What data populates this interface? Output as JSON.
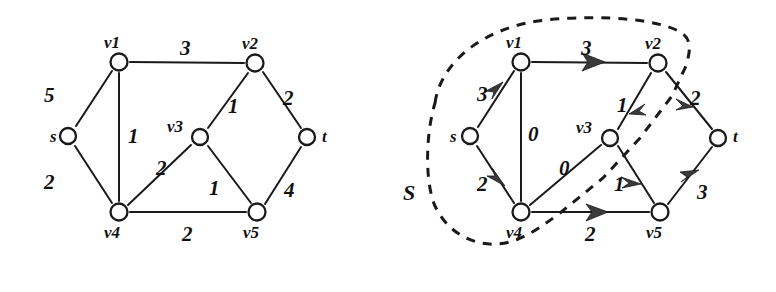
{
  "figure": {
    "background_color": "#ffffff",
    "ink_color": "#1a1a1a"
  },
  "left_graph": {
    "name": "capacity-graph",
    "nodes": [
      {
        "id": "s",
        "label": "s",
        "x": 68,
        "y": 136,
        "label_x": 50,
        "label_y": 128
      },
      {
        "id": "v1",
        "label": "v1",
        "x": 119,
        "y": 62,
        "label_x": 104,
        "label_y": 34
      },
      {
        "id": "v2",
        "label": "v2",
        "x": 255,
        "y": 63,
        "label_x": 242,
        "label_y": 35
      },
      {
        "id": "v3",
        "label": "v3",
        "x": 200,
        "y": 137,
        "label_x": 167,
        "label_y": 118
      },
      {
        "id": "v4",
        "label": "v4",
        "x": 119,
        "y": 212,
        "label_x": 104,
        "label_y": 224
      },
      {
        "id": "v5",
        "label": "v5",
        "x": 257,
        "y": 212,
        "label_x": 243,
        "label_y": 224
      },
      {
        "id": "t",
        "label": "t",
        "x": 307,
        "y": 137,
        "label_x": 322,
        "label_y": 128
      }
    ],
    "edges": [
      {
        "from": "s",
        "to": "v1",
        "weight": "5",
        "label_x": 44,
        "label_y": 85
      },
      {
        "from": "s",
        "to": "v4",
        "weight": "2",
        "label_x": 44,
        "label_y": 172
      },
      {
        "from": "v1",
        "to": "v2",
        "weight": "3",
        "label_x": 180,
        "label_y": 38
      },
      {
        "from": "v1",
        "to": "v4",
        "weight": "1",
        "label_x": 128,
        "label_y": 126
      },
      {
        "from": "v3",
        "to": "v2",
        "weight": "1",
        "label_x": 228,
        "label_y": 96
      },
      {
        "from": "v2",
        "to": "t",
        "weight": "2",
        "label_x": 283,
        "label_y": 88
      },
      {
        "from": "v4",
        "to": "v3",
        "weight": "2",
        "label_x": 156,
        "label_y": 158
      },
      {
        "from": "v3",
        "to": "v5",
        "weight": "1",
        "label_x": 209,
        "label_y": 178
      },
      {
        "from": "v4",
        "to": "v5",
        "weight": "2",
        "label_x": 182,
        "label_y": 224
      },
      {
        "from": "v5",
        "to": "t",
        "weight": "4",
        "label_x": 284,
        "label_y": 180
      }
    ]
  },
  "right_graph": {
    "name": "flow-graph",
    "set_label": "S",
    "set_label_x": 403,
    "set_label_y": 182,
    "nodes": [
      {
        "id": "s",
        "label": "s",
        "x": 470,
        "y": 136,
        "label_x": 450,
        "label_y": 128
      },
      {
        "id": "v1",
        "label": "v1",
        "x": 521,
        "y": 62,
        "label_x": 506,
        "label_y": 34
      },
      {
        "id": "v2",
        "label": "v2",
        "x": 658,
        "y": 63,
        "label_x": 645,
        "label_y": 35
      },
      {
        "id": "v3",
        "label": "v3",
        "x": 610,
        "y": 138,
        "label_x": 576,
        "label_y": 119
      },
      {
        "id": "v4",
        "label": "v4",
        "x": 521,
        "y": 212,
        "label_x": 506,
        "label_y": 224
      },
      {
        "id": "v5",
        "label": "v5",
        "x": 660,
        "y": 212,
        "label_x": 646,
        "label_y": 224
      },
      {
        "id": "t",
        "label": "t",
        "x": 718,
        "y": 138,
        "label_x": 733,
        "label_y": 128
      }
    ],
    "edges": [
      {
        "from": "s",
        "to": "v1",
        "flow": "3",
        "directed": true,
        "label_x": 477,
        "label_y": 84
      },
      {
        "from": "s",
        "to": "v4",
        "flow": "2",
        "directed": true,
        "label_x": 477,
        "label_y": 174
      },
      {
        "from": "v1",
        "to": "v2",
        "flow": "3",
        "directed": true,
        "label_x": 581,
        "label_y": 38
      },
      {
        "from": "v1",
        "to": "v4",
        "flow": "0",
        "directed": false,
        "label_x": 528,
        "label_y": 124
      },
      {
        "from": "v2",
        "to": "v3",
        "flow": "1",
        "directed": true,
        "label_x": 617,
        "label_y": 95
      },
      {
        "from": "v2",
        "to": "t",
        "flow": "2",
        "directed": true,
        "label_x": 690,
        "label_y": 88
      },
      {
        "from": "v4",
        "to": "v3",
        "flow": "0",
        "directed": false,
        "label_x": 559,
        "label_y": 158
      },
      {
        "from": "v3",
        "to": "v5",
        "flow": "1",
        "directed": true,
        "label_x": 614,
        "label_y": 174
      },
      {
        "from": "v4",
        "to": "v5",
        "flow": "2",
        "directed": true,
        "label_x": 585,
        "label_y": 224
      },
      {
        "from": "v5",
        "to": "t",
        "flow": "3",
        "directed": true,
        "label_x": 697,
        "label_y": 182
      }
    ]
  }
}
